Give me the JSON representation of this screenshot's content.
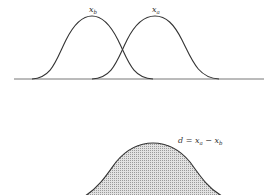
{
  "top_panel": {
    "curve_b_label": "x",
    "curve_b_sub": "b",
    "curve_a_label": "x",
    "curve_a_sub": "a"
  },
  "bottom_panel": {
    "difference_label": {
      "d": "d = x",
      "sub_a": "a",
      "minus": " − x",
      "sub_b": "b"
    }
  },
  "colors": {
    "stroke": "#333333",
    "shade": "#c8c8c8",
    "baseline": "#777777"
  }
}
